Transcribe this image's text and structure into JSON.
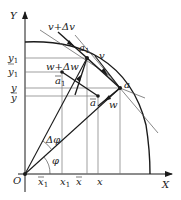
{
  "diagram": {
    "type": "kinematics-vector-diagram",
    "colors": {
      "ink": "#1a1a1a",
      "thin": "#555555",
      "grid": "#777777",
      "background": "#ffffff"
    },
    "axes": {
      "x_label": "X",
      "y_label": "Y",
      "origin_label": "O"
    },
    "y_ticks": [
      {
        "label": "y",
        "sub": "1",
        "bar": false
      },
      {
        "label": "y",
        "sub": "1",
        "bar": true
      },
      {
        "label": "y",
        "sub": "",
        "bar": false
      },
      {
        "label": "y",
        "sub": "",
        "bar": true
      }
    ],
    "x_ticks": [
      {
        "label": "x",
        "sub": "1",
        "bar": true
      },
      {
        "label": "x",
        "sub": "1",
        "bar": false
      },
      {
        "label": "x",
        "sub": "",
        "bar": true
      },
      {
        "label": "x",
        "sub": "",
        "bar": false
      }
    ],
    "points": {
      "a1": {
        "label": "a",
        "sub": "1"
      },
      "a": {
        "label": "a"
      },
      "abar1": {
        "label": "a",
        "sub": "1",
        "bar": true
      },
      "abar": {
        "label": "a",
        "bar": true
      }
    },
    "vectors": {
      "v_plus_dv": "v+Δv",
      "v": "v",
      "w_plus_dw": "w+Δw",
      "w": "w"
    },
    "angles": {
      "delta_phi": "Δφ",
      "phi": "φ"
    }
  }
}
